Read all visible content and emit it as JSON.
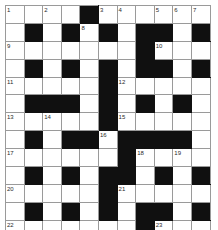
{
  "puzzle": {
    "title": "Crossword Grid",
    "columns": 11,
    "rows": 13,
    "block_color": "#101010",
    "cell_color": "#ffffff",
    "grid_line_color": "#9a9a9a",
    "number_color": "#2a2a2a",
    "max_clue_number": 23,
    "grid": [
      [
        {
          "block": false,
          "num": "1"
        },
        {
          "block": false,
          "num": ""
        },
        {
          "block": false,
          "num": "2"
        },
        {
          "block": false,
          "num": ""
        },
        {
          "block": true,
          "num": ""
        },
        {
          "block": false,
          "num": "3"
        },
        {
          "block": false,
          "num": "4"
        },
        {
          "block": false,
          "num": ""
        },
        {
          "block": false,
          "num": "5"
        },
        {
          "block": false,
          "num": "6"
        },
        {
          "block": false,
          "num": "7"
        }
      ],
      [
        {
          "block": false,
          "num": ""
        },
        {
          "block": true,
          "num": ""
        },
        {
          "block": false,
          "num": ""
        },
        {
          "block": true,
          "num": ""
        },
        {
          "block": false,
          "num": "8"
        },
        {
          "block": true,
          "num": ""
        },
        {
          "block": false,
          "num": ""
        },
        {
          "block": true,
          "num": ""
        },
        {
          "block": true,
          "num": ""
        },
        {
          "block": false,
          "num": ""
        },
        {
          "block": true,
          "num": ""
        }
      ],
      [
        {
          "block": false,
          "num": "9"
        },
        {
          "block": false,
          "num": ""
        },
        {
          "block": false,
          "num": ""
        },
        {
          "block": false,
          "num": ""
        },
        {
          "block": false,
          "num": ""
        },
        {
          "block": false,
          "num": ""
        },
        {
          "block": false,
          "num": ""
        },
        {
          "block": true,
          "num": ""
        },
        {
          "block": false,
          "num": "10"
        },
        {
          "block": false,
          "num": ""
        },
        {
          "block": false,
          "num": ""
        }
      ],
      [
        {
          "block": false,
          "num": ""
        },
        {
          "block": true,
          "num": ""
        },
        {
          "block": false,
          "num": ""
        },
        {
          "block": true,
          "num": ""
        },
        {
          "block": false,
          "num": ""
        },
        {
          "block": true,
          "num": ""
        },
        {
          "block": false,
          "num": ""
        },
        {
          "block": true,
          "num": ""
        },
        {
          "block": true,
          "num": ""
        },
        {
          "block": false,
          "num": ""
        },
        {
          "block": true,
          "num": ""
        }
      ],
      [
        {
          "block": false,
          "num": "11"
        },
        {
          "block": false,
          "num": ""
        },
        {
          "block": false,
          "num": ""
        },
        {
          "block": false,
          "num": ""
        },
        {
          "block": false,
          "num": ""
        },
        {
          "block": true,
          "num": ""
        },
        {
          "block": false,
          "num": "12"
        },
        {
          "block": false,
          "num": ""
        },
        {
          "block": false,
          "num": ""
        },
        {
          "block": false,
          "num": ""
        },
        {
          "block": false,
          "num": ""
        }
      ],
      [
        {
          "block": false,
          "num": ""
        },
        {
          "block": true,
          "num": ""
        },
        {
          "block": true,
          "num": ""
        },
        {
          "block": true,
          "num": ""
        },
        {
          "block": false,
          "num": ""
        },
        {
          "block": true,
          "num": ""
        },
        {
          "block": false,
          "num": ""
        },
        {
          "block": true,
          "num": ""
        },
        {
          "block": false,
          "num": ""
        },
        {
          "block": true,
          "num": ""
        },
        {
          "block": false,
          "num": ""
        }
      ],
      [
        {
          "block": false,
          "num": "13"
        },
        {
          "block": false,
          "num": ""
        },
        {
          "block": false,
          "num": "14"
        },
        {
          "block": false,
          "num": ""
        },
        {
          "block": false,
          "num": ""
        },
        {
          "block": true,
          "num": ""
        },
        {
          "block": false,
          "num": "15"
        },
        {
          "block": false,
          "num": ""
        },
        {
          "block": false,
          "num": ""
        },
        {
          "block": false,
          "num": ""
        },
        {
          "block": false,
          "num": ""
        }
      ],
      [
        {
          "block": false,
          "num": ""
        },
        {
          "block": true,
          "num": ""
        },
        {
          "block": false,
          "num": ""
        },
        {
          "block": true,
          "num": ""
        },
        {
          "block": true,
          "num": ""
        },
        {
          "block": false,
          "num": "16"
        },
        {
          "block": true,
          "num": ""
        },
        {
          "block": true,
          "num": ""
        },
        {
          "block": true,
          "num": ""
        },
        {
          "block": true,
          "num": ""
        },
        {
          "block": false,
          "num": ""
        }
      ],
      [
        {
          "block": false,
          "num": "17"
        },
        {
          "block": false,
          "num": ""
        },
        {
          "block": false,
          "num": ""
        },
        {
          "block": false,
          "num": ""
        },
        {
          "block": false,
          "num": ""
        },
        {
          "block": false,
          "num": ""
        },
        {
          "block": true,
          "num": ""
        },
        {
          "block": false,
          "num": "18"
        },
        {
          "block": false,
          "num": ""
        },
        {
          "block": false,
          "num": "19"
        },
        {
          "block": false,
          "num": ""
        }
      ],
      [
        {
          "block": false,
          "num": ""
        },
        {
          "block": true,
          "num": ""
        },
        {
          "block": false,
          "num": ""
        },
        {
          "block": true,
          "num": ""
        },
        {
          "block": false,
          "num": ""
        },
        {
          "block": true,
          "num": ""
        },
        {
          "block": true,
          "num": ""
        },
        {
          "block": false,
          "num": ""
        },
        {
          "block": true,
          "num": ""
        },
        {
          "block": false,
          "num": ""
        },
        {
          "block": true,
          "num": ""
        }
      ],
      [
        {
          "block": false,
          "num": "20"
        },
        {
          "block": false,
          "num": ""
        },
        {
          "block": false,
          "num": ""
        },
        {
          "block": false,
          "num": ""
        },
        {
          "block": false,
          "num": ""
        },
        {
          "block": true,
          "num": ""
        },
        {
          "block": false,
          "num": "21"
        },
        {
          "block": false,
          "num": ""
        },
        {
          "block": false,
          "num": ""
        },
        {
          "block": false,
          "num": ""
        },
        {
          "block": false,
          "num": ""
        }
      ],
      [
        {
          "block": false,
          "num": ""
        },
        {
          "block": true,
          "num": ""
        },
        {
          "block": false,
          "num": ""
        },
        {
          "block": true,
          "num": ""
        },
        {
          "block": false,
          "num": ""
        },
        {
          "block": true,
          "num": ""
        },
        {
          "block": false,
          "num": ""
        },
        {
          "block": true,
          "num": ""
        },
        {
          "block": true,
          "num": ""
        },
        {
          "block": false,
          "num": ""
        },
        {
          "block": true,
          "num": ""
        }
      ],
      [
        {
          "block": false,
          "num": "22"
        },
        {
          "block": false,
          "num": ""
        },
        {
          "block": false,
          "num": ""
        },
        {
          "block": false,
          "num": ""
        },
        {
          "block": false,
          "num": ""
        },
        {
          "block": false,
          "num": ""
        },
        {
          "block": false,
          "num": ""
        },
        {
          "block": true,
          "num": ""
        },
        {
          "block": false,
          "num": "23"
        },
        {
          "block": false,
          "num": ""
        },
        {
          "block": false,
          "num": ""
        }
      ]
    ]
  }
}
